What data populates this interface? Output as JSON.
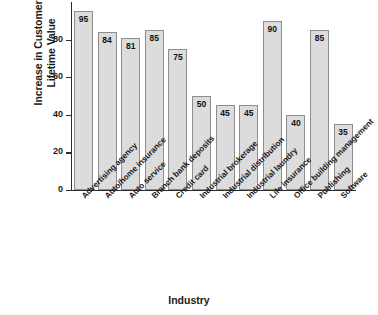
{
  "chart_data": {
    "type": "bar",
    "title": "",
    "xlabel": "Industry",
    "ylabel": "Increase in Customer Lifetime Value",
    "ylabel_line1": "Increase in Customer",
    "ylabel_line2": "Lifetime Value",
    "ylim": [
      0,
      100
    ],
    "yticks": [
      0,
      20,
      40,
      60,
      80
    ],
    "ytick_labels": [
      "0",
      "20",
      "40",
      "60",
      "80"
    ],
    "grid": false,
    "legend": null,
    "bar_fill_color": "#dcdcdc",
    "bar_border_color": "#8d8d8d",
    "axis_color": "#2b2b2b",
    "categories": [
      "Advertising agency",
      "Auto/home insurance",
      "Auto service",
      "Branch bank deposits",
      "Credit card",
      "Industrial brokerage",
      "Industrial distribution",
      "Industrial laundry",
      "Life insurance",
      "Office building management",
      "Publishing",
      "Software"
    ],
    "values": [
      95,
      84,
      81,
      85,
      75,
      50,
      45,
      45,
      90,
      40,
      85,
      35
    ],
    "value_labels": [
      "95",
      "84",
      "81",
      "85",
      "75",
      "50",
      "45",
      "45",
      "90",
      "40",
      "85",
      "35"
    ]
  }
}
